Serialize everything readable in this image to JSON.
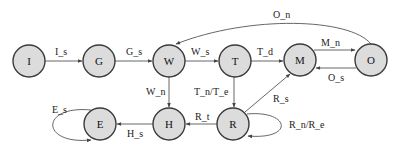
{
  "diagram": {
    "type": "state-transition",
    "nodes": [
      {
        "id": "I",
        "label": "I",
        "x": 29,
        "y": 61
      },
      {
        "id": "G",
        "label": "G",
        "x": 99,
        "y": 61
      },
      {
        "id": "W",
        "label": "W",
        "x": 169,
        "y": 61
      },
      {
        "id": "T",
        "label": "T",
        "x": 235,
        "y": 61
      },
      {
        "id": "M",
        "label": "M",
        "x": 300,
        "y": 60
      },
      {
        "id": "O",
        "label": "O",
        "x": 371,
        "y": 60
      },
      {
        "id": "E",
        "label": "E",
        "x": 100,
        "y": 124
      },
      {
        "id": "H",
        "label": "H",
        "x": 169,
        "y": 124
      },
      {
        "id": "R",
        "label": "R",
        "x": 233,
        "y": 124
      }
    ],
    "edges": [
      {
        "from": "I",
        "to": "G",
        "label": "I_s"
      },
      {
        "from": "G",
        "to": "W",
        "label": "G_s"
      },
      {
        "from": "W",
        "to": "T",
        "label": "W_s"
      },
      {
        "from": "T",
        "to": "M",
        "label": "T_d"
      },
      {
        "from": "M",
        "to": "O",
        "label": "M_n"
      },
      {
        "from": "O",
        "to": "M",
        "label": "O_s"
      },
      {
        "from": "O",
        "to": "W",
        "label": "O_n"
      },
      {
        "from": "W",
        "to": "H",
        "label": "W_n"
      },
      {
        "from": "T",
        "to": "R",
        "label": "T_n/T_e"
      },
      {
        "from": "R",
        "to": "M",
        "label": "R_s"
      },
      {
        "from": "R",
        "to": "H",
        "label": "R_t"
      },
      {
        "from": "R",
        "to": "R",
        "label": "R_n/R_e"
      },
      {
        "from": "H",
        "to": "E",
        "label": "H_s"
      },
      {
        "from": "E",
        "to": "E",
        "label": "E_s"
      }
    ]
  },
  "labels": {
    "I": "I",
    "G": "G",
    "W": "W",
    "T": "T",
    "M": "M",
    "O": "O",
    "E": "E",
    "H": "H",
    "R": "R",
    "I_s": "I_s",
    "G_s": "G_s",
    "W_s": "W_s",
    "T_d": "T_d",
    "M_n": "M_n",
    "O_s": "O_s",
    "O_n": "O_n",
    "W_n": "W_n",
    "T_n_T_e": "T_n/T_e",
    "R_s": "R_s",
    "R_t": "R_t",
    "R_n_R_e": "R_n/R_e",
    "H_s": "H_s",
    "E_s": "E_s"
  },
  "colors": {
    "node_fill": "#dcdcdc",
    "node_stroke": "#3a3a3a",
    "edge": "#555555",
    "text": "#111111"
  }
}
